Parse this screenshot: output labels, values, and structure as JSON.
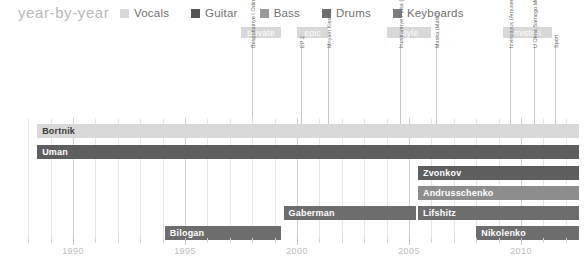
{
  "header": {
    "title": "year-by-year",
    "legend": [
      {
        "label": "Vocals",
        "color": "#d9d9d9"
      },
      {
        "label": "Guitar",
        "color": "#555555"
      },
      {
        "label": "Bass",
        "color": "#9a9a9a"
      },
      {
        "label": "Drums",
        "color": "#6e6e6e"
      },
      {
        "label": "Keyboards",
        "color": "#7e7e7e"
      }
    ]
  },
  "chart_data": {
    "type": "bar",
    "title": "year-by-year",
    "xlabel": "",
    "ylabel": "",
    "xlim": [
      1987.5,
      2012.5
    ],
    "grid": true,
    "legend_position": "top",
    "tick_labels": [
      "1990",
      "1995",
      "2000",
      "2005",
      "2010"
    ],
    "tick_years": [
      1990,
      1995,
      2000,
      2005,
      2010
    ],
    "categories": [
      "Bortnik",
      "Uman",
      "Zvonkov",
      "Andrusschenko",
      "Lifshitz",
      "Gaberman",
      "Bilogan",
      "Nikolenko"
    ],
    "bars": [
      {
        "name": "Bortnik",
        "start": 1988.4,
        "end": 2012.6,
        "color": "#d9d9d9",
        "role": "Vocals",
        "label_color": "#3a3a3a"
      },
      {
        "name": "Uman",
        "start": 1988.4,
        "end": 2012.6,
        "color": "#5e5e5e",
        "role": "Guitar",
        "label_color": "#ffffff"
      },
      {
        "name": "Zvonkov",
        "start": 2005.4,
        "end": 2012.6,
        "color": "#5e5e5e",
        "role": "Drums",
        "label_color": "#ffffff"
      },
      {
        "name": "Andrusschenko",
        "start": 2005.4,
        "end": 2012.6,
        "color": "#8d8d8d",
        "role": "Bass",
        "label_color": "#ffffff"
      },
      {
        "name": "Lifshitz",
        "start": 2005.4,
        "end": 2012.6,
        "color": "#6d6d6d",
        "role": "Keyboards",
        "label_color": "#ffffff"
      },
      {
        "name": "Gaberman",
        "start": 1999.4,
        "end": 2005.3,
        "color": "#6d6d6d",
        "role": "Keyboards",
        "label_color": "#ffffff"
      },
      {
        "name": "Bilogan",
        "start": 1994.1,
        "end": 1999.3,
        "color": "#6d6d6d",
        "role": "Keyboards",
        "label_color": "#ffffff"
      },
      {
        "name": "Nikolenko",
        "start": 2008.0,
        "end": 2012.6,
        "color": "#6d6d6d",
        "role": "Bass",
        "label_color": "#ffffff"
      }
    ],
    "albums": [
      {
        "label": "private",
        "start": 1997.5,
        "end": 1999.3
      },
      {
        "label": "epic",
        "start": 2000.0,
        "end": 2001.4
      },
      {
        "label": "style",
        "start": 2004.0,
        "end": 2006.0
      },
      {
        "label": "misteri",
        "start": 2009.2,
        "end": 2011.4
      }
    ],
    "songs": [
      {
        "label": "Bespokoinye i Odinokiye Lyudi (Restless and Sad Folks)",
        "year": 1998.0
      },
      {
        "label": "EP 2",
        "year": 2000.2
      },
      {
        "label": "Mnyam Kiss Me",
        "year": 2001.4
      },
      {
        "label": "Inostrannye Ptitsa (Foreign Land)",
        "year": 2004.6
      },
      {
        "label": "Maska (Mask)",
        "year": 2006.2
      },
      {
        "label": "Izvinyayus (Amusement Park)",
        "year": 2009.5
      },
      {
        "label": "U Okna Samogo Mudrogo (It's What Men Are Talking About)",
        "year": 2010.6
      },
      {
        "label": "Sport",
        "year": 2011.5
      }
    ]
  }
}
